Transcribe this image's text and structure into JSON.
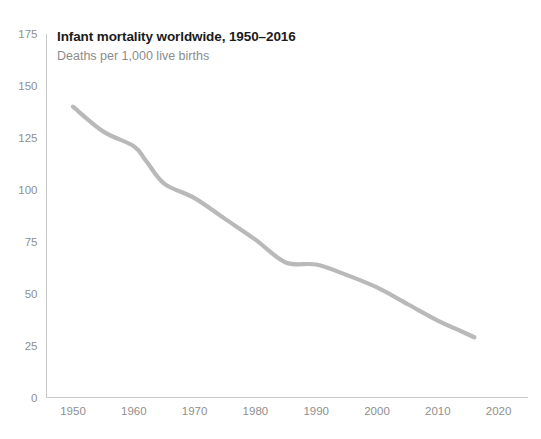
{
  "chart_data": {
    "type": "line",
    "title": "Infant mortality worldwide, 1950–2016",
    "subtitle": "Deaths per 1,000 live births",
    "xlabel": "",
    "ylabel": "",
    "xlim": [
      1946,
      2024
    ],
    "ylim": [
      0,
      175
    ],
    "grid": false,
    "legend": "none",
    "line_color": "#b9b9b9",
    "axis_color": "#c9c9c9",
    "tick_label_color": "#8f8f8f",
    "title_color": "#1b1b1b",
    "subtitle_color": "#8c8c8c",
    "xticks": [
      "1950",
      "1960",
      "1970",
      "1980",
      "1990",
      "2000",
      "2010",
      "2020"
    ],
    "xtick_values": [
      1950,
      1960,
      1970,
      1980,
      1990,
      2000,
      2010,
      2020
    ],
    "yticks": [
      "0",
      "25",
      "50",
      "75",
      "100",
      "125",
      "150",
      "175"
    ],
    "ytick_values": [
      0,
      25,
      50,
      75,
      100,
      125,
      150,
      175
    ],
    "series": [
      {
        "name": "Infant mortality rate",
        "x": [
          1950,
          1955,
          1960,
          1962,
          1965,
          1970,
          1975,
          1980,
          1985,
          1990,
          1995,
          2000,
          2005,
          2010,
          2013,
          2016
        ],
        "values": [
          140,
          128,
          121,
          114,
          103,
          96,
          86,
          76,
          65,
          64,
          59,
          53,
          45,
          37,
          33,
          29
        ]
      }
    ]
  }
}
